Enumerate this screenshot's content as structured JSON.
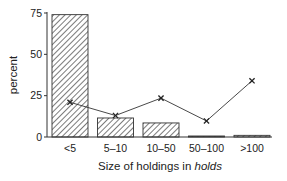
{
  "chart_data": {
    "type": "bar",
    "title": "",
    "xlabel": "Size of holdings in holds",
    "xlabel_parts": {
      "plain": "Size of holdings in ",
      "italic": "holds"
    },
    "ylabel": "percent",
    "ylim": [
      0,
      75
    ],
    "yticks": [
      0,
      25,
      50,
      75
    ],
    "categories": [
      "<5",
      "5–10",
      "10–50",
      "50–100",
      ">100"
    ],
    "series": [
      {
        "name": "bars (hatched)",
        "type": "bar",
        "values": [
          74,
          11.5,
          8.5,
          0.3,
          1
        ]
      },
      {
        "name": "line (x markers)",
        "type": "line",
        "values": [
          21,
          13,
          23.5,
          9.7,
          34
        ]
      }
    ],
    "grid": false,
    "legend": null,
    "colors": {
      "bar_fill": "#ffffff",
      "hatch": "#333333",
      "line": "#333333",
      "axis": "#333333"
    }
  }
}
